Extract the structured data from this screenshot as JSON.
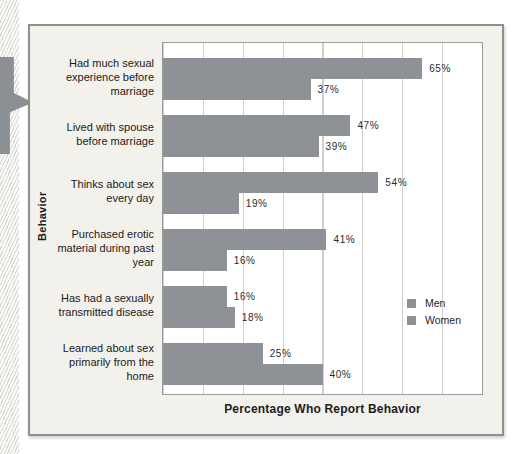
{
  "colors": {
    "bar": "#8e9296",
    "flag_marker": "#8a9094",
    "panel_bg": "#f2f1ec",
    "plot_bg": "#ffffff",
    "gridline": "#d0cfcc",
    "panel_border": "#8f8f8f"
  },
  "chart_data": {
    "type": "bar",
    "orientation": "horizontal",
    "title": "",
    "xlabel": "Percentage Who Report Behavior",
    "ylabel": "Behavior",
    "xlim": [
      0,
      80
    ],
    "grid_interval": 10,
    "grid": "vertical-lines",
    "value_suffix": "%",
    "categories": [
      "Had much sexual experience before marriage",
      "Lived with spouse before marriage",
      "Thinks about sex every day",
      "Purchased erotic material during past year",
      "Has had a sexually transmitted disease",
      "Learned about sex primarily from the home"
    ],
    "series": [
      {
        "name": "Men",
        "color": "#8e9296",
        "values": [
          65,
          47,
          54,
          41,
          16,
          25
        ]
      },
      {
        "name": "Women",
        "color": "#8e9296",
        "values": [
          37,
          39,
          19,
          16,
          18,
          40
        ]
      }
    ],
    "legend_position": "inside-right-middle"
  }
}
